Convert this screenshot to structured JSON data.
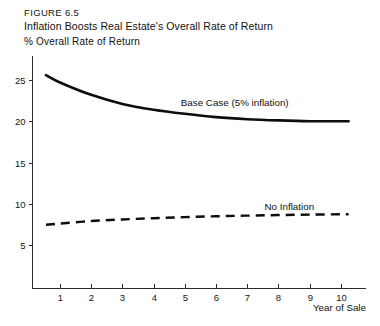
{
  "figure": {
    "number_label": "FIGURE  6.5",
    "title": "Inflation Boosts Real Estate's Overall Rate of Return",
    "y_axis_caption": "% Overall Rate of Return",
    "x_axis_caption": "Year of Sale"
  },
  "chart_data": {
    "type": "line",
    "title": "Inflation Boosts Real Estate's Overall Rate of Return",
    "subtitle": "FIGURE  6.5",
    "xlabel": "Year of Sale",
    "ylabel": "% Overall Rate of Return",
    "xlim": [
      0.4,
      10.7
    ],
    "ylim": [
      0,
      27.5
    ],
    "xticks": [
      1,
      2,
      3,
      4,
      5,
      6,
      7,
      8,
      9,
      10
    ],
    "xticklabels": [
      "1",
      "2",
      "3",
      "4",
      "5",
      "6",
      "7",
      "8",
      "9",
      "10"
    ],
    "yticks": [
      5,
      10,
      15,
      20,
      25
    ],
    "yticklabels": [
      "5",
      "10",
      "15",
      "20",
      "25"
    ],
    "grid": false,
    "legend": "inline-annotations",
    "x": [
      0.55,
      1,
      2,
      3,
      4,
      5,
      6,
      7,
      8,
      9,
      10,
      10.25
    ],
    "series": [
      {
        "name": "Base Case (5% inflation)",
        "style": "solid",
        "color": "#0d0d0d",
        "values": [
          25.6,
          24.7,
          23.2,
          22.1,
          21.4,
          20.9,
          20.5,
          20.25,
          20.1,
          20.0,
          20.0,
          20.0
        ],
        "annotation": {
          "text": "Base Case (5% inflation)",
          "x": 6.6,
          "y": 21.9
        }
      },
      {
        "name": "No Inflation",
        "style": "dashed",
        "color": "#0d0d0d",
        "values": [
          7.45,
          7.6,
          7.9,
          8.1,
          8.25,
          8.38,
          8.48,
          8.56,
          8.63,
          8.68,
          8.72,
          8.73
        ],
        "annotation": {
          "text": "No Inflation",
          "x": 8.35,
          "y": 9.3
        }
      }
    ]
  }
}
